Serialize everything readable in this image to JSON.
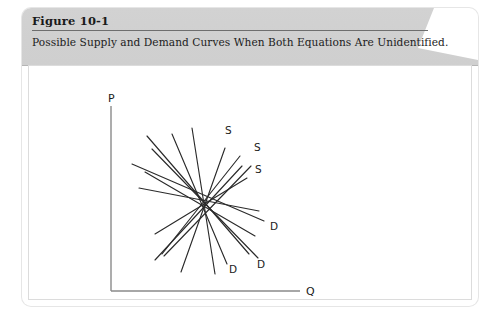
{
  "figure": {
    "number_label": "Figure 10-1",
    "caption": "Possible Supply and Demand Curves When Both Equations Are Unidentified.",
    "header_bg": "#d0d0d0",
    "card_bg": "#ffffff"
  },
  "chart_data": {
    "type": "line",
    "title": "Possible Supply and Demand Curves When Both Equations Are Unidentified.",
    "xlabel": "Q",
    "ylabel": "P",
    "grid": false,
    "legend": "none",
    "axis_color": "#8a8a8a",
    "line_color": "#2b2b2b",
    "intersection_point": {
      "x": 245,
      "y": 196
    },
    "axes": {
      "y_axis": {
        "x": 152,
        "y_top": 100,
        "y_bottom": 285
      },
      "x_axis": {
        "y": 285,
        "x_left": 152,
        "x_right": 341
      }
    },
    "axis_labels": [
      {
        "text": "P",
        "x": 149,
        "y": 96
      },
      {
        "text": "Q",
        "x": 347,
        "y": 289
      }
    ],
    "rays": [
      {
        "id": "ray-1",
        "label": "S",
        "slope": "positive",
        "x1": 213,
        "y1": 128,
        "x2": 268,
        "y2": 258
      },
      {
        "id": "ray-2",
        "label": "S",
        "slope": "positive",
        "x1": 193,
        "y1": 143,
        "x2": 299,
        "y2": 252
      },
      {
        "id": "ray-3",
        "label": "S",
        "slope": "positive",
        "x1": 186,
        "y1": 166,
        "x2": 296,
        "y2": 230
      },
      {
        "id": "ray-4",
        "label": "S",
        "slope": "steep-positive",
        "x1": 233,
        "y1": 122,
        "x2": 256,
        "y2": 268
      },
      {
        "id": "ray-5",
        "label": "D",
        "slope": "negative",
        "x1": 188,
        "y1": 130,
        "x2": 290,
        "y2": 248
      },
      {
        "id": "ray-6",
        "label": "D",
        "slope": "negative",
        "x1": 173,
        "y1": 158,
        "x2": 305,
        "y2": 215
      },
      {
        "id": "ray-7",
        "label": "D",
        "slope": "negative",
        "x1": 203,
        "y1": 248,
        "x2": 281,
        "y2": 150
      },
      {
        "id": "ray-8",
        "label": "D",
        "slope": "negative",
        "x1": 196,
        "y1": 228,
        "x2": 288,
        "y2": 172
      },
      {
        "id": "ray-9",
        "label": "D",
        "slope": "negative",
        "x1": 196,
        "y1": 254,
        "x2": 283,
        "y2": 160
      },
      {
        "id": "ray-10",
        "label": "D",
        "slope": "negative",
        "x1": 222,
        "y1": 266,
        "x2": 266,
        "y2": 142
      },
      {
        "id": "ray-11",
        "label": "S",
        "slope": "positive",
        "x1": 205,
        "y1": 250,
        "x2": 292,
        "y2": 160
      },
      {
        "id": "ray-12",
        "label": "S",
        "slope": "positive",
        "x1": 180,
        "y1": 182,
        "x2": 300,
        "y2": 205
      }
    ],
    "curve_labels": [
      {
        "text": "S",
        "x": 266,
        "y": 128,
        "curve": "supply-1"
      },
      {
        "text": "S",
        "x": 295,
        "y": 145,
        "curve": "supply-2"
      },
      {
        "text": "S",
        "x": 296,
        "y": 167,
        "curve": "supply-3"
      },
      {
        "text": "D",
        "x": 311,
        "y": 224,
        "curve": "demand-1"
      },
      {
        "text": "D",
        "x": 298,
        "y": 262,
        "curve": "demand-2"
      },
      {
        "text": "D",
        "x": 270,
        "y": 267,
        "curve": "demand-3"
      }
    ]
  }
}
